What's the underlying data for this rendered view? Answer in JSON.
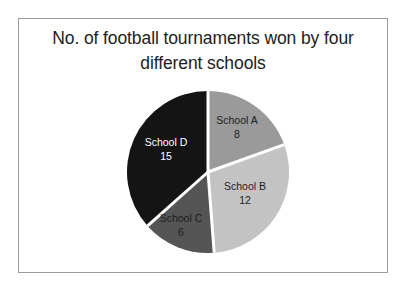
{
  "figure": {
    "background_color": "#ffffff",
    "frame_color": "#9b9b9b",
    "title": "No. of football tournaments won by four\ndifferent  schools"
  },
  "chart_data": {
    "type": "pie",
    "title": "No. of football tournaments won by four different  schools",
    "xlabel": "",
    "ylabel": "",
    "total": 41,
    "start_angle_deg": 0,
    "direction": "clockwise",
    "legend": "none",
    "grid": false,
    "categories": [
      "School A",
      "School B",
      "School C",
      "School D"
    ],
    "values": [
      8,
      12,
      6,
      15
    ],
    "colors": [
      "#9a9a9a",
      "#c3c3c3",
      "#555555",
      "#141414"
    ],
    "label_text_colors": [
      "#1d1d1d",
      "#1d1d1d",
      "#1d1d1d",
      "#ffffff"
    ],
    "separator_color": "#ffffff",
    "slices": [
      {
        "name": "School A",
        "value": 8,
        "value_label": "8",
        "color": "#9a9a9a",
        "angle_deg": 70.2,
        "percent": 19.5
      },
      {
        "name": "School B",
        "value": 12,
        "value_label": "12",
        "color": "#c3c3c3",
        "angle_deg": 105.4,
        "percent": 29.3
      },
      {
        "name": "School C",
        "value": 6,
        "value_label": "6",
        "color": "#555555",
        "angle_deg": 52.7,
        "percent": 14.6
      },
      {
        "name": "School D",
        "value": 15,
        "value_label": "15",
        "color": "#141414",
        "angle_deg": 131.7,
        "percent": 36.6
      }
    ]
  },
  "labels": {
    "school_a": "School A\n8",
    "school_b": "School B\n12",
    "school_c": "School C\n6",
    "school_d": "School D\n15"
  }
}
